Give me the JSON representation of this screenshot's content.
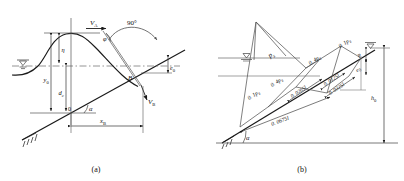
{
  "figure": {
    "title_a": "(a)",
    "title_b": "(b)"
  },
  "panel_a": {
    "caption": "(a)",
    "labels": {
      "velocity_A": "V",
      "velocity_A_sub": "A",
      "velocity_B": "V",
      "velocity_B_sub": "B",
      "angle_phi": "φ",
      "angle_90": "90°",
      "angle_alpha": "α",
      "point_B": "B",
      "eta": "η",
      "y0": "y",
      "y0_sub": "0",
      "dc": "d",
      "dc_sub": "c",
      "origin": "0",
      "e0": "e",
      "e0_sub": "0",
      "xB": "x",
      "xB_sub": "B"
    }
  },
  "panel_b": {
    "caption": "(b)",
    "labels": {
      "ps": "p",
      "ps_sub": "s",
      "p_01_left": "0. 1p",
      "p_01_left_sub": "s",
      "p_04_left": "0. 4p",
      "p_04_left_sub": "s",
      "p_04_right": "0. 4p",
      "p_04_right_sub": "s",
      "p_01_right": "0. 1p",
      "p_01_right_sub": "s",
      "dim_00265": "0. 0265l",
      "dim_00125": "0. 0125l",
      "dim_00325": "0. 0325l",
      "dim_00675": "0. 0675l",
      "h0": "h",
      "h0_sub": "0",
      "R": "R",
      "e0": "e",
      "e0_sub": "0",
      "angle_alpha": "α"
    }
  },
  "colors": {
    "line": "#1a1a1a",
    "water": "#6b6b6b",
    "dash": "#7a7a7a"
  }
}
